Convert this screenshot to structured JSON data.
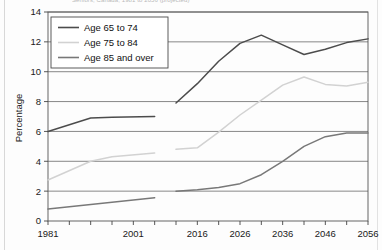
{
  "page": {
    "cut_off_title": "Seniors, Canada, 1981 to 2056 (projected)"
  },
  "chart_data": {
    "type": "line",
    "title": "Seniors, Canada, 1981 to 2056 (projected)",
    "xlabel": "",
    "ylabel": "Percentage",
    "ylim": [
      0,
      14
    ],
    "ytick_step": 2,
    "yticks": [
      "0",
      "2",
      "4",
      "6",
      "8",
      "10",
      "12",
      "14"
    ],
    "xlim": [
      1981,
      2056
    ],
    "xticks": [
      "1981",
      "2001",
      "2016",
      "2026",
      "2036",
      "2046",
      "2056"
    ],
    "xtick_values": [
      1981,
      2001,
      2016,
      2026,
      2036,
      2046,
      2056
    ],
    "grid": "horizontal",
    "legend_position": "top-left",
    "series": [
      {
        "name": "Age 65 to 74",
        "color": "#4c4c4c",
        "historical": {
          "x": [
            1981,
            1991,
            1996,
            2006
          ],
          "y": [
            6.0,
            6.9,
            6.95,
            7.0
          ]
        },
        "projected": {
          "x": [
            2011,
            2016,
            2021,
            2026,
            2031,
            2036,
            2041,
            2046,
            2051,
            2056
          ],
          "y": [
            7.9,
            9.2,
            10.7,
            11.9,
            12.45,
            11.8,
            11.15,
            11.5,
            11.95,
            12.2
          ]
        }
      },
      {
        "name": "Age 75 to 84",
        "color": "#d2d2d2",
        "historical": {
          "x": [
            1981,
            1991,
            1996,
            2006
          ],
          "y": [
            2.75,
            4.0,
            4.3,
            4.55
          ]
        },
        "projected": {
          "x": [
            2011,
            2016,
            2021,
            2026,
            2031,
            2036,
            2041,
            2046,
            2051,
            2056
          ],
          "y": [
            4.8,
            4.9,
            5.95,
            7.1,
            8.1,
            9.1,
            9.65,
            9.15,
            9.05,
            9.3
          ]
        }
      },
      {
        "name": "Age 85 and over",
        "color": "#787878",
        "historical": {
          "x": [
            1981,
            2006
          ],
          "y": [
            0.8,
            1.55
          ]
        },
        "projected": {
          "x": [
            2011,
            2016,
            2021,
            2026,
            2031,
            2036,
            2041,
            2046,
            2051,
            2056
          ],
          "y": [
            2.0,
            2.1,
            2.25,
            2.5,
            3.1,
            4.0,
            5.0,
            5.65,
            5.9,
            5.9
          ]
        }
      }
    ]
  }
}
